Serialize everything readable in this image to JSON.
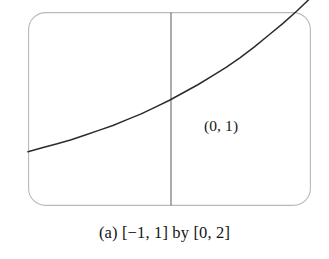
{
  "figure": {
    "caption": "(a) [−1, 1] by [0, 2]",
    "panel_letter": "(a)",
    "x_range_text": "[−1, 1]",
    "connector_text": "by",
    "y_range_text": "[0, 2]"
  },
  "annotations": {
    "intercept_label": "(0, 1)"
  },
  "colors": {
    "background": "#ffffff",
    "window_border": "#b9b9b9",
    "axis": "#6f6f6f",
    "curve": "#2b2b2b",
    "text": "#141414"
  },
  "chart_data": {
    "type": "line",
    "title": "",
    "subtitle": "",
    "xlabel": "",
    "ylabel": "",
    "xlim": [
      -1,
      1
    ],
    "ylim": [
      0,
      2
    ],
    "grid": false,
    "legend": null,
    "axes_shown": [
      "y-axis at x = 0"
    ],
    "xticks": [],
    "yticks": [],
    "annotations": [
      {
        "text": "(0, 1)",
        "x": 0.0,
        "y": 1.0,
        "placement": "right-below"
      }
    ],
    "series": [
      {
        "name": "exponential",
        "x": [
          -1.0,
          -0.9,
          -0.8,
          -0.7,
          -0.6,
          -0.5,
          -0.4,
          -0.3,
          -0.2,
          -0.1,
          0.0,
          0.1,
          0.2,
          0.3,
          0.4,
          0.5,
          0.6,
          0.7,
          0.8,
          0.9,
          1.0
        ],
        "values": [
          0.56,
          0.6,
          0.64,
          0.68,
          0.73,
          0.78,
          0.83,
          0.89,
          0.95,
          1.02,
          1.09,
          1.17,
          1.25,
          1.34,
          1.43,
          1.53,
          1.64,
          1.76,
          1.88,
          2.01,
          2.15
        ]
      }
    ]
  }
}
